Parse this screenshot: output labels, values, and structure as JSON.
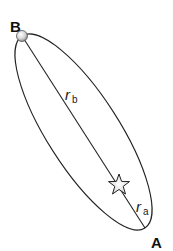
{
  "diagram": {
    "type": "elliptical-orbit",
    "labels": {
      "aphelion_point": "B",
      "perihelion_point": "A",
      "r_b_main": "r",
      "r_b_sub": "b",
      "r_a_main": "r",
      "r_a_sub": "a"
    },
    "elements": {
      "orbit": "ellipse",
      "major_axis_line": "line from B through star to perihelion",
      "star": "star at focus",
      "planet": "small sphere at point B"
    },
    "colors": {
      "line": "#222222",
      "star_fill": "#e8e8e8",
      "planet_fill": "#cfcfcf",
      "label": "#111111"
    }
  }
}
